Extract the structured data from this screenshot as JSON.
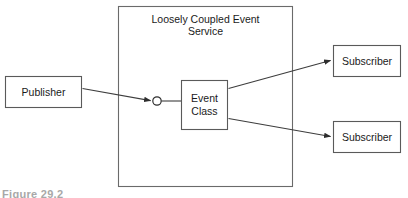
{
  "diagram": {
    "type": "component-diagram",
    "container": {
      "label_line1": "Loosely Coupled Event",
      "label_line2": "Service",
      "bounds": {
        "x": 118,
        "y": 6,
        "width": 175,
        "height": 181
      }
    },
    "nodes": [
      {
        "name": "publisher",
        "label_line1": "Publisher",
        "label_line2": "",
        "bounds": {
          "x": 5,
          "y": 76,
          "width": 77,
          "height": 32
        }
      },
      {
        "name": "event-class",
        "label_line1": "Event",
        "label_line2": "Class",
        "bounds": {
          "x": 181,
          "y": 80,
          "width": 47,
          "height": 50
        }
      },
      {
        "name": "subscriber-top",
        "label_line1": "Subscriber",
        "label_line2": "",
        "bounds": {
          "x": 333,
          "y": 45,
          "width": 68,
          "height": 32
        }
      },
      {
        "name": "subscriber-bottom",
        "label_line1": "Subscriber",
        "label_line2": "",
        "bounds": {
          "x": 333,
          "y": 121,
          "width": 68,
          "height": 32
        }
      }
    ],
    "interface_port": {
      "name": "event-interface-port",
      "cx": 157,
      "cy": 101,
      "r": 4.2
    },
    "edges": [
      {
        "name": "publisher-to-event-interface",
        "from": "publisher",
        "to": "event-interface-port"
      },
      {
        "name": "event-class-to-subscriber-top",
        "from": "event-class",
        "to": "subscriber-top"
      },
      {
        "name": "event-class-to-subscriber-bottom",
        "from": "event-class",
        "to": "subscriber-bottom"
      }
    ]
  },
  "caption": {
    "text": "Figure 29.2"
  },
  "colors": {
    "box_stroke": "#5a5a5a",
    "container_stroke": "#6a6a6a",
    "edge_stroke": "#3d3d3d",
    "text": "#1a1a1a",
    "background": "#ffffff",
    "caption": "#a8a8a8"
  }
}
